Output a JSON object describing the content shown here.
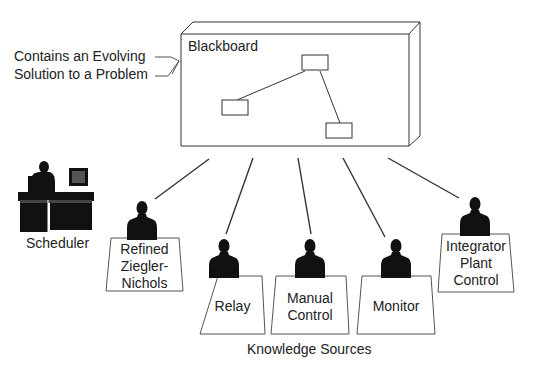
{
  "diagram": {
    "annotation": {
      "line1": "Contains an Evolving",
      "line2": "Solution to a Problem"
    },
    "blackboard": {
      "label": "Blackboard"
    },
    "scheduler": {
      "label": "Scheduler"
    },
    "knowledge_sources": {
      "caption": "Knowledge Sources",
      "items": [
        {
          "lines": [
            "Refined",
            "Ziegler-",
            "Nichols"
          ]
        },
        {
          "lines": [
            "Relay"
          ]
        },
        {
          "lines": [
            "Manual",
            "Control"
          ]
        },
        {
          "lines": [
            "Monitor"
          ]
        },
        {
          "lines": [
            "Integrator",
            "Plant",
            "Control"
          ]
        }
      ]
    },
    "colors": {
      "line": "#333333",
      "silhouette": "#111111",
      "background": "#ffffff"
    }
  }
}
